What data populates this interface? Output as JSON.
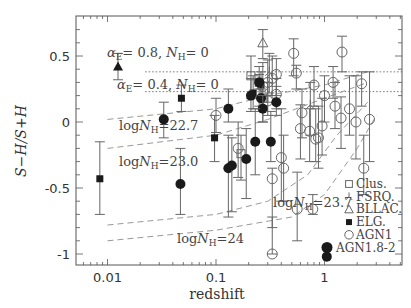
{
  "chart_data": {
    "type": "scatter",
    "title": "",
    "xlabel": "redshift",
    "ylabel": "S−H/S+H",
    "xscale": "log",
    "xlim": [
      0.0045,
      4.0
    ],
    "ylim": [
      -1.1,
      0.78
    ],
    "x_ticks": [
      {
        "value": 0.01,
        "label": "0.01"
      },
      {
        "value": 0.1,
        "label": "0.1"
      },
      {
        "value": 1,
        "label": "1"
      }
    ],
    "y_ticks": [
      {
        "value": 0.5,
        "label": "0.5"
      },
      {
        "value": 0,
        "label": "0"
      },
      {
        "value": -0.5,
        "label": "-0.5"
      },
      {
        "value": -1,
        "label": "-1"
      }
    ],
    "grid": false,
    "legend_position": "lower right",
    "legend": [
      {
        "symbol": "open-square",
        "label": "Clus."
      },
      {
        "symbol": "tripod",
        "label": "FSRQ."
      },
      {
        "symbol": "open-triangle",
        "label": "BLLAC."
      },
      {
        "symbol": "filled-square",
        "label": "ELG."
      },
      {
        "symbol": "open-circle",
        "label": "AGN1"
      },
      {
        "symbol": "filled-circle",
        "label": "AGN1.8-2"
      }
    ],
    "reference_lines": [
      {
        "label": "αE = 0.8, NH = 0",
        "y": 0.38,
        "style": "dotted",
        "x_from": 0.02,
        "x_to": 4.0
      },
      {
        "label": "αE = 0.4, NH = 0",
        "y": 0.23,
        "style": "dotted",
        "x_from": 0.02,
        "x_to": 4.0
      }
    ],
    "model_curves": [
      {
        "label": "logNH = 22.7",
        "style": "dashed",
        "points": [
          [
            0.01,
            0.02
          ],
          [
            0.1,
            0.1
          ],
          [
            0.3,
            0.2
          ],
          [
            1.0,
            0.28
          ],
          [
            2.5,
            0.38
          ]
        ]
      },
      {
        "label": "logNH = 23.0",
        "style": "dashed",
        "points": [
          [
            0.01,
            -0.2
          ],
          [
            0.1,
            -0.1
          ],
          [
            0.3,
            0.02
          ],
          [
            1.0,
            0.18
          ],
          [
            2.5,
            0.3
          ]
        ]
      },
      {
        "label": "logNH = 23.7",
        "style": "dashed",
        "points": [
          [
            0.01,
            -0.78
          ],
          [
            0.1,
            -0.7
          ],
          [
            0.3,
            -0.6
          ],
          [
            0.7,
            -0.4
          ],
          [
            1.3,
            -0.1
          ],
          [
            2.5,
            0.15
          ]
        ]
      },
      {
        "label": "logNH = 24",
        "style": "dashed",
        "points": [
          [
            0.01,
            -0.9
          ],
          [
            0.1,
            -0.82
          ],
          [
            0.5,
            -0.72
          ],
          [
            1.0,
            -0.55
          ],
          [
            2.0,
            -0.2
          ],
          [
            3.0,
            0.05
          ]
        ]
      }
    ],
    "series": [
      {
        "name": "Clus.",
        "symbol": "open-square",
        "points": [
          {
            "x": 0.17,
            "y": -0.24,
            "yerr": [
              -0.1,
              -0.44
            ]
          },
          {
            "x": 0.21,
            "y": 0.35,
            "yerr": [
              0.5,
              0.18
            ]
          },
          {
            "x": 0.25,
            "y": 0.3,
            "yerr": [
              0.42,
              0.12
            ]
          },
          {
            "x": 0.27,
            "y": 0.18,
            "yerr": [
              0.3,
              0.0
            ]
          }
        ]
      },
      {
        "name": "FSRQ.",
        "symbol": "tripod",
        "points": [
          {
            "x": 0.31,
            "y": 0.38,
            "yerr": [
              0.52,
              0.22
            ]
          },
          {
            "x": 0.74,
            "y": 0.13,
            "yerr": [
              0.3,
              -0.1
            ]
          }
        ]
      },
      {
        "name": "BLLAC.",
        "symbol": "open-triangle",
        "points": [
          {
            "x": 0.27,
            "y": 0.6,
            "yerr": [
              0.7,
              0.48
            ]
          }
        ]
      },
      {
        "name": "ELG.",
        "symbol": "filled-square",
        "points": [
          {
            "x": 0.0085,
            "y": -0.43,
            "yerr": [
              -0.15,
              -0.7
            ]
          },
          {
            "x": 0.048,
            "y": 0.18,
            "yerr": [
              0.28,
              0.08
            ]
          },
          {
            "x": 0.097,
            "y": -0.12,
            "yerr": [
              0.05,
              -0.3
            ]
          },
          {
            "x": 0.22,
            "y": 0.22,
            "yerr": [
              0.35,
              0.1
            ]
          },
          {
            "x": 0.26,
            "y": 0.28,
            "yerr": [
              0.38,
              0.18
            ]
          }
        ]
      },
      {
        "name": "AGN1",
        "symbol": "open-circle",
        "points": [
          {
            "x": 0.1,
            "y": 0.05,
            "yerr": [
              0.18,
              -0.08
            ]
          },
          {
            "x": 0.16,
            "y": -0.2,
            "yerr": [
              0.0,
              -0.42
            ]
          },
          {
            "x": 0.27,
            "y": 0.27,
            "yerr": [
              0.45,
              0.12
            ]
          },
          {
            "x": 0.3,
            "y": 0.3,
            "yerr": [
              0.47,
              0.15
            ]
          },
          {
            "x": 0.33,
            "y": 0.33,
            "yerr": [
              0.5,
              0.2
            ]
          },
          {
            "x": 0.36,
            "y": 0.36,
            "yerr": [
              0.48,
              0.2
            ]
          },
          {
            "x": 0.36,
            "y": 0.21,
            "yerr": [
              0.33,
              0.1
            ]
          },
          {
            "x": 0.3,
            "y": 0.16,
            "yerr": [
              0.3,
              0.05
            ]
          },
          {
            "x": 0.4,
            "y": -0.27,
            "yerr": [
              0.1,
              -0.6
            ]
          },
          {
            "x": 0.33,
            "y": -0.43,
            "yerr": [
              -0.35,
              -0.8
            ]
          },
          {
            "x": 0.42,
            "y": -0.35,
            "yerr": [
              -0.1,
              -0.6
            ]
          },
          {
            "x": 0.52,
            "y": 0.52,
            "yerr": [
              0.63,
              0.35
            ]
          },
          {
            "x": 0.55,
            "y": 0.37,
            "yerr": [
              0.43,
              0.25
            ]
          },
          {
            "x": 0.62,
            "y": 0.07,
            "yerr": [
              0.25,
              -0.12
            ]
          },
          {
            "x": 0.6,
            "y": -0.05,
            "yerr": [
              0.13,
              -0.28
            ]
          },
          {
            "x": 0.73,
            "y": -0.07,
            "yerr": [
              0.1,
              -0.3
            ]
          },
          {
            "x": 0.8,
            "y": 0.28,
            "yerr": [
              0.42,
              0.12
            ]
          },
          {
            "x": 0.83,
            "y": -0.13,
            "yerr": [
              0.1,
              -0.3
            ]
          },
          {
            "x": 1.0,
            "y": 0.2,
            "yerr": [
              0.35,
              0.0
            ]
          },
          {
            "x": 0.88,
            "y": -0.12,
            "yerr": [
              0.12,
              -0.35
            ]
          },
          {
            "x": 0.95,
            "y": -0.03,
            "yerr": [
              0.18,
              -0.25
            ]
          },
          {
            "x": 1.2,
            "y": 0.3,
            "yerr": [
              0.42,
              0.18
            ]
          },
          {
            "x": 1.42,
            "y": 0.03,
            "yerr": [
              0.19,
              -0.2
            ]
          },
          {
            "x": 1.25,
            "y": 0.12,
            "yerr": [
              0.3,
              -0.05
            ]
          },
          {
            "x": 1.45,
            "y": 0.53,
            "yerr": [
              0.65,
              0.38
            ]
          },
          {
            "x": 1.7,
            "y": 0.1,
            "yerr": [
              0.35,
              -0.1
            ]
          },
          {
            "x": 1.95,
            "y": 0.0,
            "yerr": [
              0.35,
              -0.28
            ]
          },
          {
            "x": 2.2,
            "y": 0.29,
            "yerr": [
              0.38,
              0.12
            ]
          },
          {
            "x": 2.3,
            "y": -0.35,
            "yerr": [
              -0.1,
              -0.55
            ]
          },
          {
            "x": 2.6,
            "y": 0.02,
            "yerr": [
              0.38,
              -0.3
            ]
          },
          {
            "x": 0.33,
            "y": -1.0,
            "yerr": [
              -0.72,
              -1.0
            ]
          },
          {
            "x": 0.56,
            "y": -0.66,
            "yerr": [
              -0.38,
              -0.9
            ]
          },
          {
            "x": 0.78,
            "y": -0.66,
            "yerr": [
              -0.55,
              -0.7
            ]
          }
        ]
      },
      {
        "name": "AGN1.8-2",
        "symbol": "filled-circle",
        "points": [
          {
            "x": 0.033,
            "y": 0.02,
            "yerr": [
              0.15,
              -0.12
            ]
          },
          {
            "x": 0.047,
            "y": -0.47,
            "yerr": [
              -0.2,
              -0.7
            ]
          },
          {
            "x": 0.13,
            "y": 0.1,
            "yerr": [
              0.25,
              0.0
            ]
          },
          {
            "x": 0.13,
            "y": -0.35,
            "yerr": [
              -0.1,
              -0.72
            ]
          },
          {
            "x": 0.14,
            "y": -0.33,
            "yerr": [
              -0.12,
              -0.68
            ]
          },
          {
            "x": 0.19,
            "y": -0.28,
            "yerr": [
              -0.05,
              -0.58
            ]
          },
          {
            "x": 0.21,
            "y": 0.2,
            "yerr": [
              0.33,
              0.08
            ]
          },
          {
            "x": 0.25,
            "y": 0.3,
            "yerr": [
              0.36,
              0.25
            ]
          },
          {
            "x": 0.26,
            "y": 0.18,
            "yerr": [
              0.25,
              0.08
            ]
          },
          {
            "x": 0.27,
            "y": 0.1,
            "yerr": [
              0.2,
              0.0
            ]
          },
          {
            "x": 0.23,
            "y": -0.15,
            "yerr": [
              0.1,
              -0.4
            ]
          },
          {
            "x": 0.32,
            "y": -0.15,
            "yerr": [
              0.08,
              -0.3
            ]
          },
          {
            "x": 0.36,
            "y": 0.15,
            "yerr": [
              0.27,
              0.05
            ]
          },
          {
            "x": 1.05,
            "y": -1.02,
            "yerr": [
              -1.02,
              -1.02
            ]
          }
        ]
      },
      {
        "name": "alpha-marker",
        "symbol": "filled-triangle",
        "points": [
          {
            "x": 0.0125,
            "y": 0.42,
            "yerr": [
              0.52,
              0.32
            ]
          }
        ]
      }
    ]
  },
  "annotations": {
    "alpha08": {
      "alpha_sub": "E",
      "text_a": "= 0.8, ",
      "nh_sub": "H",
      "text_b": "= 0"
    },
    "alpha04": {
      "alpha_sub": "E",
      "text_a": "= 0.4, ",
      "nh_sub": "H",
      "text_b": "= 0"
    },
    "nh227": {
      "log": "log",
      "sub": "H",
      "value": "=22.7"
    },
    "nh230": {
      "log": "log",
      "sub": "H",
      "value": "=23.0"
    },
    "nh237": {
      "log": "log",
      "sub": "H",
      "value": "=23.7"
    },
    "nh24": {
      "log": "log",
      "sub": "H",
      "value": "=24"
    }
  },
  "colors": {
    "axis": "#555555",
    "marker": "#1a1a1a",
    "open_marker": "#666666",
    "errorbar": "#666666",
    "dashed": "#999999",
    "dotted": "#666666",
    "text": "#333333"
  }
}
